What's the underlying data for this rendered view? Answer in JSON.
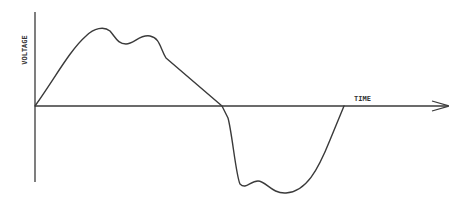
{
  "diagram": {
    "title": "",
    "y_axis_label": "VOLTAGE",
    "x_axis_label": "TIME",
    "colors": {
      "stroke": "#3a3a3a",
      "background": "#ffffff"
    },
    "features": [
      {
        "name": "positive-peak-1",
        "x": 101,
        "y": 30
      },
      {
        "name": "positive-dip",
        "x": 122,
        "y": 43
      },
      {
        "name": "positive-peak-2",
        "x": 146,
        "y": 35
      },
      {
        "name": "zero-crossing",
        "x": 222,
        "y": 106
      },
      {
        "name": "negative-trough-1",
        "x": 232,
        "y": 187
      },
      {
        "name": "negative-bump",
        "x": 257,
        "y": 181
      },
      {
        "name": "negative-trough-2",
        "x": 285,
        "y": 193
      },
      {
        "name": "end-crossing",
        "x": 344,
        "y": 106
      }
    ]
  }
}
